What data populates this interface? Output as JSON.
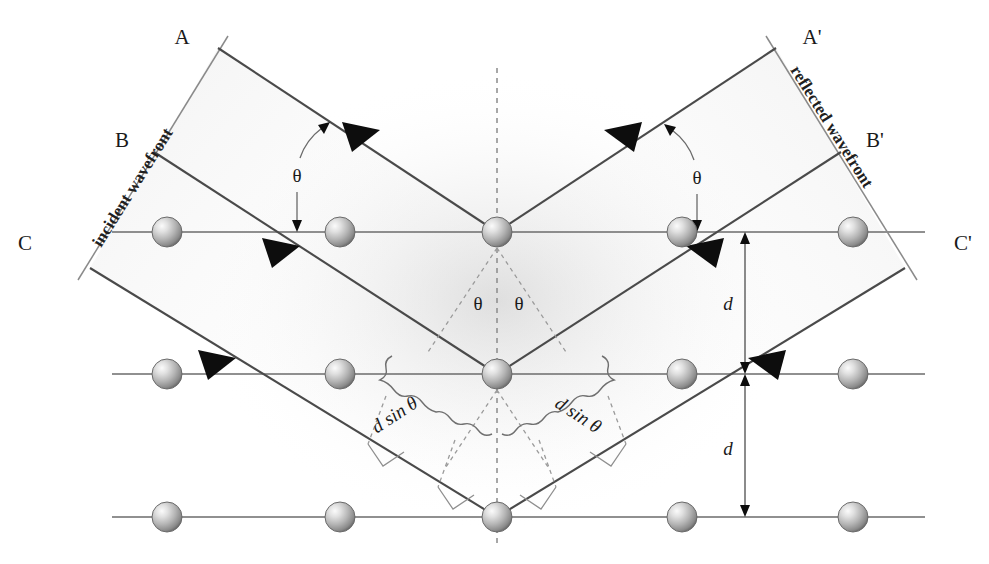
{
  "figure": {
    "background_color": "#ffffff",
    "width": 989,
    "height": 564
  },
  "labels": {
    "ray_a": "A",
    "ray_b": "B",
    "ray_c": "C",
    "ray_a_prime": "A'",
    "ray_b_prime": "B'",
    "ray_c_prime": "C'",
    "incident_wavefront": "incident wavefront",
    "reflected_wavefront": "reflected wavefront",
    "theta_incident": "θ",
    "theta_reflected": "θ",
    "theta_center_left": "θ",
    "theta_center_right": "θ",
    "path_left": "d sin θ",
    "path_right": "d sin θ",
    "spacing_upper": "d",
    "spacing_lower": "d"
  },
  "colors": {
    "ray": "#4a4a4a",
    "plane": "#6b6b6b",
    "wavefront": "#8a8a8a",
    "dashed": "#8a8a8a",
    "arrowhead": "#0d0d0d",
    "atom_light": "#f2f2f2",
    "atom_mid": "#a8a8a8",
    "atom_dark": "#5e5e5e",
    "text": "#1a1a1a"
  },
  "geometry": {
    "planes": [
      {
        "name": "top-plane",
        "y": 232,
        "x_start": 112,
        "x_end": 925
      },
      {
        "name": "middle-plane",
        "y": 374,
        "x_start": 112,
        "x_end": 925
      },
      {
        "name": "bottom-plane",
        "y": 517,
        "x_start": 112,
        "x_end": 925
      }
    ],
    "atoms": [
      {
        "row": "top",
        "cx": 167,
        "cy": 232,
        "r": 15
      },
      {
        "row": "top",
        "cx": 340,
        "cy": 232,
        "r": 15
      },
      {
        "row": "top",
        "cx": 497,
        "cy": 232,
        "r": 15
      },
      {
        "row": "top",
        "cx": 682,
        "cy": 232,
        "r": 15
      },
      {
        "row": "top",
        "cx": 853,
        "cy": 232,
        "r": 15
      },
      {
        "row": "middle",
        "cx": 167,
        "cy": 374,
        "r": 15
      },
      {
        "row": "middle",
        "cx": 340,
        "cy": 374,
        "r": 15
      },
      {
        "row": "middle",
        "cx": 497,
        "cy": 374,
        "r": 15
      },
      {
        "row": "middle",
        "cx": 682,
        "cy": 374,
        "r": 15
      },
      {
        "row": "middle",
        "cx": 853,
        "cy": 374,
        "r": 15
      },
      {
        "row": "bottom",
        "cx": 167,
        "cy": 517,
        "r": 15
      },
      {
        "row": "bottom",
        "cx": 340,
        "cy": 517,
        "r": 15
      },
      {
        "row": "bottom",
        "cx": 497,
        "cy": 517,
        "r": 15
      },
      {
        "row": "bottom",
        "cx": 682,
        "cy": 517,
        "r": 15
      },
      {
        "row": "bottom",
        "cx": 853,
        "cy": 517,
        "r": 15
      }
    ],
    "scatter_points": [
      {
        "name": "top-scatter",
        "x": 497,
        "y": 232
      },
      {
        "name": "middle-scatter",
        "x": 497,
        "y": 374
      },
      {
        "name": "bottom-scatter",
        "x": 497,
        "y": 517
      }
    ],
    "normal_line": {
      "x": 497,
      "y_top": 68,
      "y_bottom": 548
    },
    "spacing_d": 142
  },
  "physics": {
    "relation": "2 d sin θ = n λ",
    "description": "Path difference between rays reflected from adjacent planes equals 2 d sin theta."
  }
}
